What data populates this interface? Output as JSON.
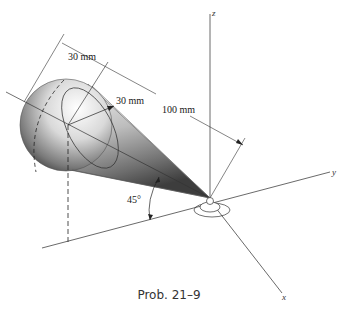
{
  "figure": {
    "caption": "Prob. 21–9",
    "axes": {
      "x": "x",
      "y": "y",
      "z": "z"
    },
    "dimensions": {
      "sphere_width": "30 mm",
      "sphere_radius": "30 mm",
      "cone_length": "100 mm"
    },
    "angle_label": "45°"
  }
}
